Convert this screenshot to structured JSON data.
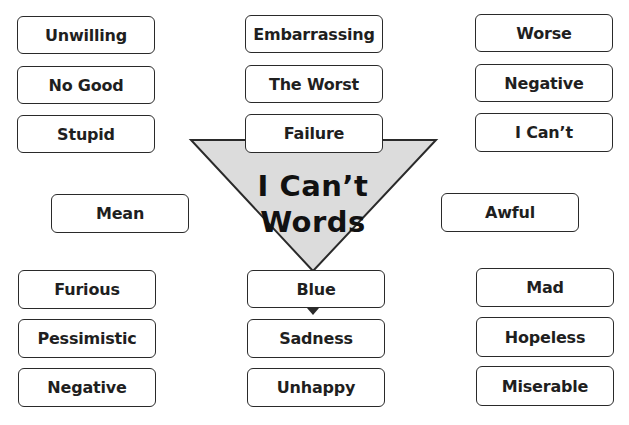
{
  "diagram": {
    "title_line1": "I Can’t",
    "title_line2": "Words",
    "funnel_fill": "#dcdcdc",
    "stroke_color": "#2a2a2a",
    "top_left": [
      "Unwilling",
      "No Good",
      "Stupid"
    ],
    "top_center": [
      "Embarrassing",
      "The Worst",
      "Failure"
    ],
    "top_right": [
      "Worse",
      "Negative",
      "I Can’t"
    ],
    "middle_left": "Mean",
    "middle_right": "Awful",
    "bottom_left": [
      "Furious",
      "Pessimistic",
      "Negative"
    ],
    "bottom_center": [
      "Blue",
      "Sadness",
      "Unhappy"
    ],
    "bottom_right": [
      "Mad",
      "Hopeless",
      "Miserable"
    ]
  }
}
